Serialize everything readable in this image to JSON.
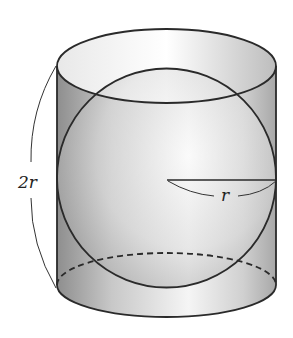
{
  "diagram": {
    "labels": {
      "height": "2r",
      "radius": "r"
    },
    "colors": {
      "stroke": "#2a2a2a",
      "shade_dark": "#9a9a9a",
      "shade_light": "#f4f4f4"
    }
  }
}
